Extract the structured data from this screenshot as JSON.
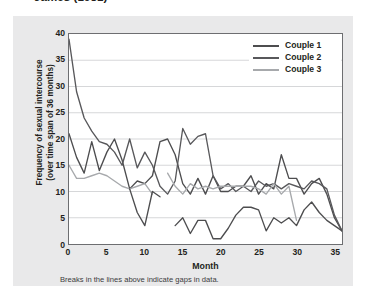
{
  "source_caption": "James (1981)",
  "figure": {
    "note": "Breaks in the lines above indicate gaps in data.",
    "y_axis_title_line1": "Frequency of sexual intercourse",
    "y_axis_title_line2": "(over time span of 36 months)",
    "x_axis_title": "Month"
  },
  "colors": {
    "panel_background": "#e9e9ea",
    "plot_background": "#ffffff",
    "axis": "#6d6e71",
    "gridline": "#d6d7d9",
    "couple1": "#4d4d4f",
    "couple2": "#58585b",
    "couple3": "#a7a9ac",
    "text": "#231f20"
  },
  "chart_data": {
    "type": "line",
    "title": "James (1981)",
    "xlabel": "Month",
    "ylabel": "Frequency of sexual intercourse (over time span of 36 months)",
    "xlim": [
      0,
      36
    ],
    "ylim": [
      0,
      40
    ],
    "xticks": [
      0,
      5,
      10,
      15,
      20,
      25,
      30,
      35
    ],
    "yticks": [
      0,
      5,
      10,
      15,
      20,
      25,
      30,
      35,
      40
    ],
    "grid": "horizontal",
    "legend_position": "top-right",
    "note": "Breaks in the lines above indicate gaps in data.",
    "series": [
      {
        "name": "Couple 1",
        "color": "#4d4d4f",
        "points": [
          [
            0,
            21
          ],
          [
            1,
            16.5
          ],
          [
            2,
            13.5
          ],
          [
            3,
            19.5
          ],
          [
            4,
            14
          ],
          [
            5,
            17.5
          ],
          [
            6,
            20
          ],
          [
            7,
            16
          ],
          [
            8,
            10.5
          ],
          [
            9,
            12
          ],
          [
            10,
            11.5
          ],
          [
            11,
            13
          ],
          [
            12,
            19.5
          ],
          [
            13,
            20
          ],
          [
            14,
            17
          ],
          [
            15,
            11.5
          ],
          [
            16,
            9.5
          ],
          [
            17,
            12.5
          ],
          [
            18,
            9.5
          ],
          [
            19,
            13
          ],
          [
            20,
            10
          ],
          [
            21,
            10
          ],
          [
            22,
            11
          ],
          [
            23,
            11
          ],
          [
            24,
            13
          ],
          [
            25,
            9.5
          ],
          [
            26,
            11.5
          ],
          [
            27,
            10.5
          ],
          [
            28,
            17
          ],
          [
            29,
            12.5
          ],
          [
            30,
            12.5
          ],
          [
            31,
            9.5
          ],
          [
            32,
            11.5
          ],
          [
            33,
            12.5
          ],
          [
            34,
            9.5
          ],
          [
            35,
            5
          ],
          [
            36,
            2.5
          ]
        ]
      },
      {
        "name": "Couple 2",
        "color": "#58585b",
        "points": [
          [
            0,
            39
          ],
          [
            1,
            29
          ],
          [
            2,
            24
          ],
          [
            3,
            21.5
          ],
          [
            4,
            19.5
          ],
          [
            5,
            19
          ],
          [
            6,
            17.5
          ],
          [
            7,
            15
          ],
          [
            8,
            20
          ],
          [
            9,
            14.5
          ],
          [
            10,
            17.5
          ],
          [
            11,
            15
          ],
          [
            12,
            11
          ],
          [
            13,
            9.5
          ],
          [
            14,
            12
          ],
          [
            15,
            22
          ],
          [
            16,
            19
          ],
          [
            17,
            20.5
          ],
          [
            18,
            21
          ],
          [
            19,
            13
          ],
          [
            20,
            10.5
          ],
          [
            21,
            11.5
          ],
          [
            22,
            10
          ],
          [
            23,
            11
          ],
          [
            24,
            10
          ],
          [
            25,
            12
          ],
          [
            26,
            11
          ],
          [
            27,
            11.5
          ],
          [
            28,
            10.5
          ],
          [
            29,
            11.5
          ],
          [
            30,
            11
          ],
          [
            31,
            10.5
          ],
          [
            32,
            12
          ],
          [
            33,
            11.5
          ],
          [
            34,
            10.5
          ],
          [
            35,
            5.5
          ],
          [
            36,
            2.5
          ]
        ]
      },
      {
        "name": "Couple 3",
        "color": "#a7a9ac",
        "segments": [
          {
            "points": [
              [
                0,
                15
              ],
              [
                1,
                12.5
              ],
              [
                2,
                12.5
              ],
              [
                3,
                13
              ],
              [
                4,
                13.5
              ],
              [
                5,
                13
              ],
              [
                6,
                12
              ],
              [
                7,
                11
              ],
              [
                8,
                10.5
              ],
              [
                9,
                11
              ],
              [
                10,
                11.5
              ],
              [
                11,
                9.5
              ]
            ]
          },
          {
            "points": [
              [
                13,
                13.5
              ],
              [
                14,
                11
              ],
              [
                15,
                9.5
              ],
              [
                16,
                11.5
              ],
              [
                17,
                10.5
              ],
              [
                18,
                11
              ],
              [
                19,
                10.5
              ],
              [
                20,
                11
              ],
              [
                21,
                11
              ],
              [
                22,
                11
              ],
              [
                23,
                11
              ],
              [
                24,
                11
              ],
              [
                25,
                10.5
              ],
              [
                26,
                9.5
              ],
              [
                27,
                11.5
              ],
              [
                28,
                9.5
              ],
              [
                29,
                11
              ],
              [
                30,
                4.5
              ]
            ]
          }
        ],
        "note": "break between month 11 and month 13"
      },
      {
        "name": "Couple 1 low segment",
        "color": "#4d4d4f",
        "is_sub_segment_of": "Couple 1",
        "segments": [
          {
            "points": [
              [
                8,
                10.5
              ],
              [
                9,
                6
              ],
              [
                10,
                3.5
              ],
              [
                11,
                10
              ],
              [
                12,
                9
              ]
            ]
          },
          {
            "points": [
              [
                14,
                3.5
              ],
              [
                15,
                5
              ],
              [
                16,
                2
              ],
              [
                17,
                4.5
              ],
              [
                18,
                4.5
              ],
              [
                19,
                1
              ],
              [
                20,
                1
              ],
              [
                21,
                3
              ],
              [
                22,
                5.5
              ],
              [
                23,
                7
              ],
              [
                24,
                7
              ],
              [
                25,
                6.5
              ],
              [
                26,
                2.5
              ],
              [
                27,
                5
              ],
              [
                28,
                4
              ],
              [
                29,
                5
              ],
              [
                30,
                3.5
              ],
              [
                31,
                6.5
              ],
              [
                32,
                8
              ],
              [
                33,
                6
              ],
              [
                34,
                4.5
              ],
              [
                35,
                3.5
              ],
              [
                36,
                2.5
              ]
            ]
          }
        ]
      }
    ]
  },
  "legend": {
    "items": [
      {
        "label": "Couple 1",
        "color": "#4d4d4f"
      },
      {
        "label": "Couple 2",
        "color": "#58585b"
      },
      {
        "label": "Couple 3",
        "color": "#a7a9ac"
      }
    ]
  }
}
